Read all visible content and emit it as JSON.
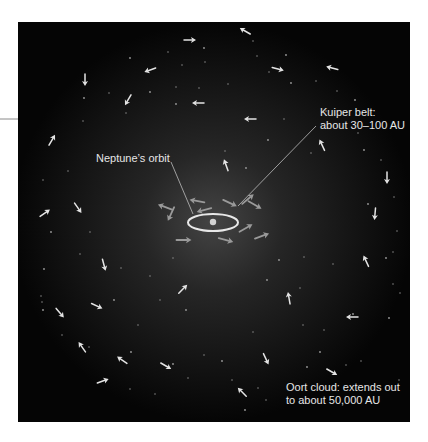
{
  "diagram": {
    "panel": {
      "x": 18,
      "y": 22,
      "width": 392,
      "height": 400,
      "background": "#050505"
    },
    "edge_tick": {
      "x1": 0,
      "y1": 119,
      "x2": 18,
      "y2": 119,
      "color": "#8a8a8a"
    },
    "glow": {
      "cx": 213,
      "cy": 222,
      "rx": 200,
      "ry": 200,
      "inner_color": "#444444",
      "outer_color": "#050505"
    },
    "sun": {
      "cx": 213,
      "cy": 222,
      "r": 3.2,
      "color": "#d2d2d2"
    },
    "neptune_orbit": {
      "cx": 213,
      "cy": 222.5,
      "rx": 25,
      "ry": 8.5,
      "stroke": "#e8e8e8",
      "stroke_width": 2
    },
    "colors": {
      "oort_arrow": "#e4e4e4",
      "kuiper_arrow": "#9a9a9a",
      "leader_line": "#bdbdbd",
      "label_text": "#e6e6e6",
      "star_dot": "#9c9c9c"
    }
  },
  "labels": {
    "kuiper_belt": {
      "lines": [
        "Kuiper belt:",
        "about 30–100 AU"
      ],
      "x": 320,
      "y": 106
    },
    "neptunes_orbit": {
      "lines": [
        "Neptune’s orbit"
      ],
      "x": 96,
      "y": 152
    },
    "oort_cloud": {
      "lines": [
        "Oort cloud: extends out",
        "to about 50,000 AU"
      ],
      "x": 286,
      "y": 381
    }
  },
  "leader_lines": [
    {
      "name": "neptune-orbit-leader",
      "x1": 171,
      "y1": 162,
      "x2": 193,
      "y2": 214
    },
    {
      "name": "kuiper-belt-leader",
      "x1": 316,
      "y1": 126,
      "x2": 238,
      "y2": 206
    }
  ],
  "oort_arrows": [
    {
      "x": 190,
      "y": 40,
      "angle": 0
    },
    {
      "x": 150,
      "y": 70,
      "angle": 160
    },
    {
      "x": 85,
      "y": 80,
      "angle": 90
    },
    {
      "x": 128,
      "y": 100,
      "angle": 120
    },
    {
      "x": 198,
      "y": 103,
      "angle": 180
    },
    {
      "x": 52,
      "y": 140,
      "angle": -60
    },
    {
      "x": 245,
      "y": 31,
      "angle": -150
    },
    {
      "x": 278,
      "y": 69,
      "angle": 15
    },
    {
      "x": 332,
      "y": 68,
      "angle": -165
    },
    {
      "x": 250,
      "y": 119,
      "angle": 180
    },
    {
      "x": 322,
      "y": 145,
      "angle": -115
    },
    {
      "x": 226,
      "y": 165,
      "angle": -110
    },
    {
      "x": 387,
      "y": 178,
      "angle": 90
    },
    {
      "x": 375,
      "y": 214,
      "angle": 95
    },
    {
      "x": 45,
      "y": 213,
      "angle": -35
    },
    {
      "x": 78,
      "y": 208,
      "angle": 55
    },
    {
      "x": 104,
      "y": 265,
      "angle": 75
    },
    {
      "x": 183,
      "y": 289,
      "angle": -45
    },
    {
      "x": 97,
      "y": 306,
      "angle": 25
    },
    {
      "x": 60,
      "y": 313,
      "angle": 50
    },
    {
      "x": 82,
      "y": 347,
      "angle": -125
    },
    {
      "x": 122,
      "y": 360,
      "angle": -145
    },
    {
      "x": 166,
      "y": 366,
      "angle": 30
    },
    {
      "x": 103,
      "y": 381,
      "angle": -20
    },
    {
      "x": 366,
      "y": 261,
      "angle": -115
    },
    {
      "x": 289,
      "y": 298,
      "angle": -100
    },
    {
      "x": 352,
      "y": 317,
      "angle": 180
    },
    {
      "x": 266,
      "y": 359,
      "angle": 65
    },
    {
      "x": 332,
      "y": 372,
      "angle": 30
    },
    {
      "x": 242,
      "y": 392,
      "angle": -135
    }
  ],
  "kuiper_arrows": [
    {
      "x": 165,
      "y": 207,
      "angle": -160
    },
    {
      "x": 171,
      "y": 214,
      "angle": 115
    },
    {
      "x": 197,
      "y": 201,
      "angle": -170
    },
    {
      "x": 204,
      "y": 210,
      "angle": 165
    },
    {
      "x": 230,
      "y": 203,
      "angle": 25
    },
    {
      "x": 248,
      "y": 199,
      "angle": -40
    },
    {
      "x": 255,
      "y": 205,
      "angle": 30
    },
    {
      "x": 246,
      "y": 228,
      "angle": -30
    },
    {
      "x": 262,
      "y": 236,
      "angle": -20
    },
    {
      "x": 184,
      "y": 240,
      "angle": 0
    },
    {
      "x": 226,
      "y": 240,
      "angle": 15
    }
  ],
  "stars": [
    [
      130,
      58
    ],
    [
      168,
      52
    ],
    [
      182,
      65
    ],
    [
      204,
      48
    ],
    [
      205,
      62
    ],
    [
      228,
      84
    ],
    [
      150,
      92
    ],
    [
      109,
      93
    ],
    [
      176,
      87
    ],
    [
      84,
      98
    ],
    [
      83,
      121
    ],
    [
      126,
      113
    ],
    [
      176,
      104
    ],
    [
      199,
      88
    ],
    [
      253,
      41
    ],
    [
      286,
      55
    ],
    [
      269,
      72
    ],
    [
      257,
      56
    ],
    [
      291,
      83
    ],
    [
      316,
      81
    ],
    [
      337,
      91
    ],
    [
      355,
      100
    ],
    [
      326,
      111
    ],
    [
      358,
      133
    ],
    [
      364,
      150
    ],
    [
      381,
      160
    ],
    [
      394,
      197
    ],
    [
      368,
      204
    ],
    [
      397,
      231
    ],
    [
      311,
      153
    ],
    [
      268,
      140
    ],
    [
      284,
      119
    ],
    [
      225,
      151
    ],
    [
      246,
      168
    ],
    [
      68,
      171
    ],
    [
      43,
      180
    ],
    [
      51,
      232
    ],
    [
      80,
      254
    ],
    [
      90,
      232
    ],
    [
      44,
      269
    ],
    [
      41,
      296
    ],
    [
      42,
      302
    ],
    [
      43,
      310
    ],
    [
      62,
      335
    ],
    [
      89,
      347
    ],
    [
      131,
      352
    ],
    [
      130,
      389
    ],
    [
      155,
      394
    ],
    [
      173,
      364
    ],
    [
      188,
      378
    ],
    [
      204,
      355
    ],
    [
      222,
      361
    ],
    [
      253,
      332
    ],
    [
      258,
      388
    ],
    [
      307,
      367
    ],
    [
      346,
      365
    ],
    [
      361,
      361
    ],
    [
      353,
      314
    ],
    [
      324,
      330
    ],
    [
      333,
      264
    ],
    [
      386,
      258
    ],
    [
      393,
      252
    ],
    [
      393,
      284
    ],
    [
      389,
      318
    ],
    [
      400,
      293
    ],
    [
      399,
      380
    ],
    [
      320,
      352
    ],
    [
      303,
      325
    ],
    [
      232,
      380
    ],
    [
      245,
      410
    ],
    [
      266,
      400
    ],
    [
      304,
      257
    ],
    [
      279,
      260
    ],
    [
      300,
      288
    ],
    [
      160,
      300
    ],
    [
      186,
      310
    ],
    [
      138,
      325
    ],
    [
      121,
      268
    ],
    [
      114,
      300
    ],
    [
      150,
      276
    ],
    [
      173,
      258
    ],
    [
      267,
      280
    ]
  ]
}
